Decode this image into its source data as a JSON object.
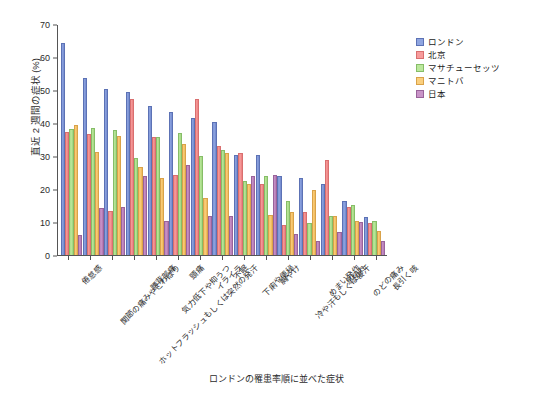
{
  "chart_data": {
    "type": "bar",
    "title": "ロンドンの罹患率順に並べた症状",
    "xlabel": "",
    "ylabel": "直近 2 週間の症状 (%)",
    "ylim": [
      0,
      70
    ],
    "yticks": [
      0,
      10,
      20,
      30,
      40,
      50,
      60,
      70
    ],
    "grid": false,
    "legend_position": "right",
    "categories": [
      "倦怠感",
      "関節の痛みやこわばり",
      "ホットフラッシュもしくは突然の発汗",
      "腰背部痛",
      "気力低下や抑うつ",
      "頭痛",
      "イライラ",
      "不眠",
      "下痢や便秘",
      "胸やけ",
      "冷や汗もしくは寝汗",
      "めまい発作",
      "息切れ",
      "のどの痛み",
      "長引く咳"
    ],
    "series": [
      {
        "name": "ロンドン",
        "color": "#8fa5e0",
        "values": [
          64.6,
          53.8,
          50.6,
          49.6,
          45.3,
          43.6,
          41.7,
          40.4,
          30.5,
          30.4,
          24.2,
          23.4,
          21.6,
          16.4,
          11.6
        ]
      },
      {
        "name": "北京",
        "color": "#f79c9c",
        "values": [
          37.3,
          36.9,
          13.5,
          47.5,
          35.9,
          24.4,
          47.4,
          33.1,
          31.0,
          21.7,
          9.0,
          13.1,
          28.9,
          14.5,
          9.8
        ]
      },
      {
        "name": "マサチューセッツ",
        "color": "#bbe89c",
        "values": [
          38.3,
          38.7,
          38.0,
          29.4,
          35.8,
          37.1,
          30.1,
          31.9,
          22.5,
          23.9,
          16.4,
          9.7,
          11.9,
          15.3,
          10.4
        ]
      },
      {
        "name": "マニトバ",
        "color": "#facf7e",
        "values": [
          39.7,
          31.4,
          36.1,
          26.7,
          23.3,
          33.7,
          17.3,
          30.9,
          21.7,
          12.3,
          13.2,
          19.7,
          12.0,
          10.5,
          7.2
        ]
      },
      {
        "name": "日本",
        "color": "#c994c8",
        "values": [
          6.2,
          14.3,
          14.7,
          24.1,
          10.3,
          27.4,
          11.8,
          11.9,
          24.2,
          24.3,
          6.4,
          4.2,
          6.9,
          9.9,
          4.4
        ]
      }
    ]
  }
}
